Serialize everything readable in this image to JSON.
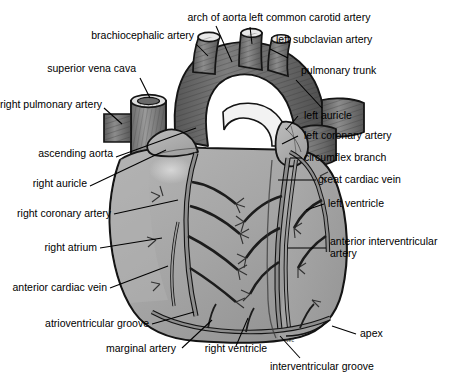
{
  "figure": {
    "style": "grayscale medical illustration with leader lines",
    "background_color": "#ffffff",
    "colors": {
      "background": "#ffffff",
      "myocardium_light": "#a8a8a8",
      "myocardium_mid": "#949494",
      "great_vessel_dark": "#6e6e6e",
      "great_vessel_darker": "#5a5a5a",
      "vessel_outline": "#1a1a1a",
      "coronary_vessel": "#8a8a8a",
      "label_text": "#000000",
      "leader_line": "#000000",
      "highlight": "#c9c9c9"
    },
    "signature_mark": "vec"
  },
  "labels": [
    {
      "id": "arch-of-aorta",
      "text": "arch of aorta",
      "side": "top",
      "align": "c"
    },
    {
      "id": "left-common-carotid-artery",
      "text": "left common carotid artery",
      "side": "top",
      "align": "r"
    },
    {
      "id": "brachiocephalic-artery",
      "text": "brachiocephalic artery",
      "side": "left",
      "align": "l"
    },
    {
      "id": "left-subclavian-artery",
      "text": "left subclavian artery",
      "side": "right",
      "align": "r"
    },
    {
      "id": "superior-vena-cava",
      "text": "superior vena cava",
      "side": "left",
      "align": "l"
    },
    {
      "id": "pulmonary-trunk",
      "text": "pulmonary trunk",
      "side": "right",
      "align": "r"
    },
    {
      "id": "right-pulmonary-artery",
      "text": "right pulmonary artery",
      "side": "left",
      "align": "l"
    },
    {
      "id": "left-auricle",
      "text": "left auricle",
      "side": "right",
      "align": "r"
    },
    {
      "id": "left-coronary-artery",
      "text": "left coronary artery",
      "side": "right",
      "align": "r"
    },
    {
      "id": "ascending-aorta",
      "text": "ascending aorta",
      "side": "left",
      "align": "l"
    },
    {
      "id": "circumflex-branch",
      "text": "circumflex branch",
      "side": "right",
      "align": "r"
    },
    {
      "id": "right-auricle",
      "text": "right auricle",
      "side": "left",
      "align": "l"
    },
    {
      "id": "great-cardiac-vein",
      "text": "great cardiac vein",
      "side": "right",
      "align": "r"
    },
    {
      "id": "right-coronary-artery",
      "text": "right coronary artery",
      "side": "left",
      "align": "l"
    },
    {
      "id": "left-ventricle",
      "text": "left ventricle",
      "side": "right",
      "align": "r"
    },
    {
      "id": "right-atrium",
      "text": "right atrium",
      "side": "left",
      "align": "l"
    },
    {
      "id": "anterior-interventricular-artery",
      "text": "anterior interventricular artery",
      "side": "right",
      "align": "r"
    },
    {
      "id": "anterior-cardiac-vein",
      "text": "anterior cardiac vein",
      "side": "left",
      "align": "l"
    },
    {
      "id": "atrioventricular-groove",
      "text": "atrioventricular groove",
      "side": "bottom",
      "align": "l"
    },
    {
      "id": "marginal-artery",
      "text": "marginal artery",
      "side": "bottom",
      "align": "c"
    },
    {
      "id": "right-ventricle",
      "text": "right ventricle",
      "side": "bottom",
      "align": "c"
    },
    {
      "id": "apex",
      "text": "apex",
      "side": "right",
      "align": "r"
    },
    {
      "id": "interventricular-groove",
      "text": "interventricular groove",
      "side": "bottom",
      "align": "r"
    }
  ]
}
